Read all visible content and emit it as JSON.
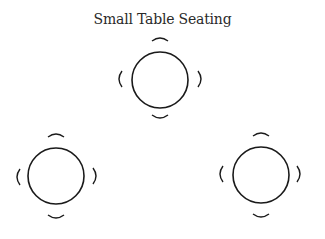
{
  "title": "Small Table Seating",
  "colors": {
    "stroke": "#1a1a1a",
    "background": "#ffffff"
  },
  "tables": [
    {
      "id": "table-top",
      "cx": 160,
      "cy": 80,
      "r": 28,
      "seats": 4
    },
    {
      "id": "table-bottom-left",
      "cx": 56,
      "cy": 176,
      "r": 28,
      "seats": 4
    },
    {
      "id": "table-bottom-right",
      "cx": 261,
      "cy": 175,
      "r": 28,
      "seats": 4
    }
  ]
}
